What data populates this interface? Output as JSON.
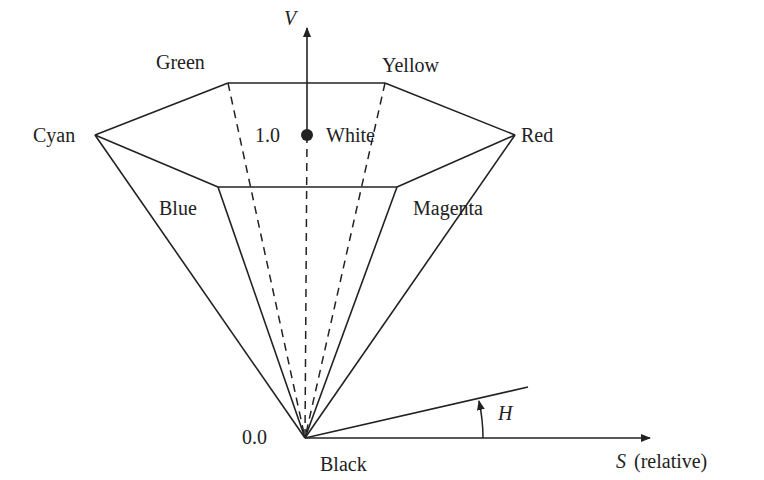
{
  "diagram": {
    "axis_v_label": "V",
    "axis_s_label_letter": "S",
    "axis_s_label_suffix": "(relative)",
    "angle_label": "H",
    "value_top": "1.0",
    "value_bottom": "0.0",
    "vertices": {
      "green": "Green",
      "yellow": "Yellow",
      "cyan": "Cyan",
      "red": "Red",
      "blue": "Blue",
      "magenta": "Magenta",
      "white": "White",
      "black": "Black"
    },
    "colors": {
      "line": "#222222",
      "background": "#ffffff"
    }
  }
}
